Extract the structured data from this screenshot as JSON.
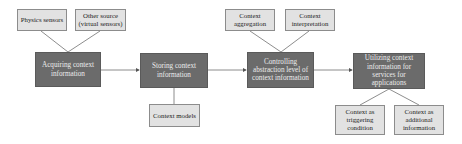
{
  "diagram": {
    "main_steps": [
      {
        "id": "acquiring",
        "label": "Acquiring context information"
      },
      {
        "id": "storing",
        "label": "Storing context information"
      },
      {
        "id": "controlling",
        "label": "Controlling abstraction level of context information"
      },
      {
        "id": "utilizing",
        "label": "Utilizing context information for services for applications"
      }
    ],
    "sub_nodes": {
      "physics_sensors": "Physics sensors",
      "other_source": "Other source (virtual sensors)",
      "context_models": "Context models",
      "context_aggregation": "Context aggregation",
      "context_interpretation": "Context interpretation",
      "context_triggering": "Context as triggering condition",
      "context_additional": "Context as additional information"
    },
    "colors": {
      "main_box": "#6b6b6b",
      "sub_box": "#e2e2e2",
      "line": "#707070"
    }
  }
}
